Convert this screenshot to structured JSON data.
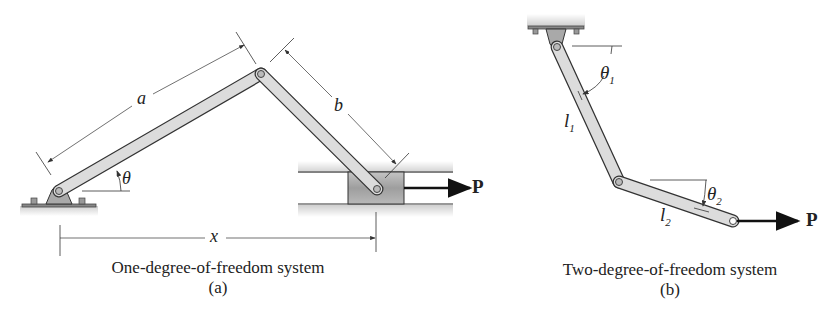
{
  "figure_a": {
    "labels": {
      "a": "a",
      "b": "b",
      "theta": "θ",
      "x": "x",
      "P": "P"
    },
    "caption": "One-degree-of-freedom system",
    "sub_label": "(a)"
  },
  "figure_b": {
    "labels": {
      "theta1": "θ",
      "theta1_sub": "1",
      "theta2": "θ",
      "theta2_sub": "2",
      "l1": "l",
      "l1_sub": "1",
      "l2": "l",
      "l2_sub": "2",
      "P": "P"
    },
    "caption": "Two-degree-of-freedom system",
    "sub_label": "(b)"
  },
  "colors": {
    "link_fill": "#dcdcdc",
    "link_stroke": "#333333",
    "ground_shade": "#bdbdbd",
    "block_fill": "#a8a8a8",
    "arrow": "#111111"
  }
}
